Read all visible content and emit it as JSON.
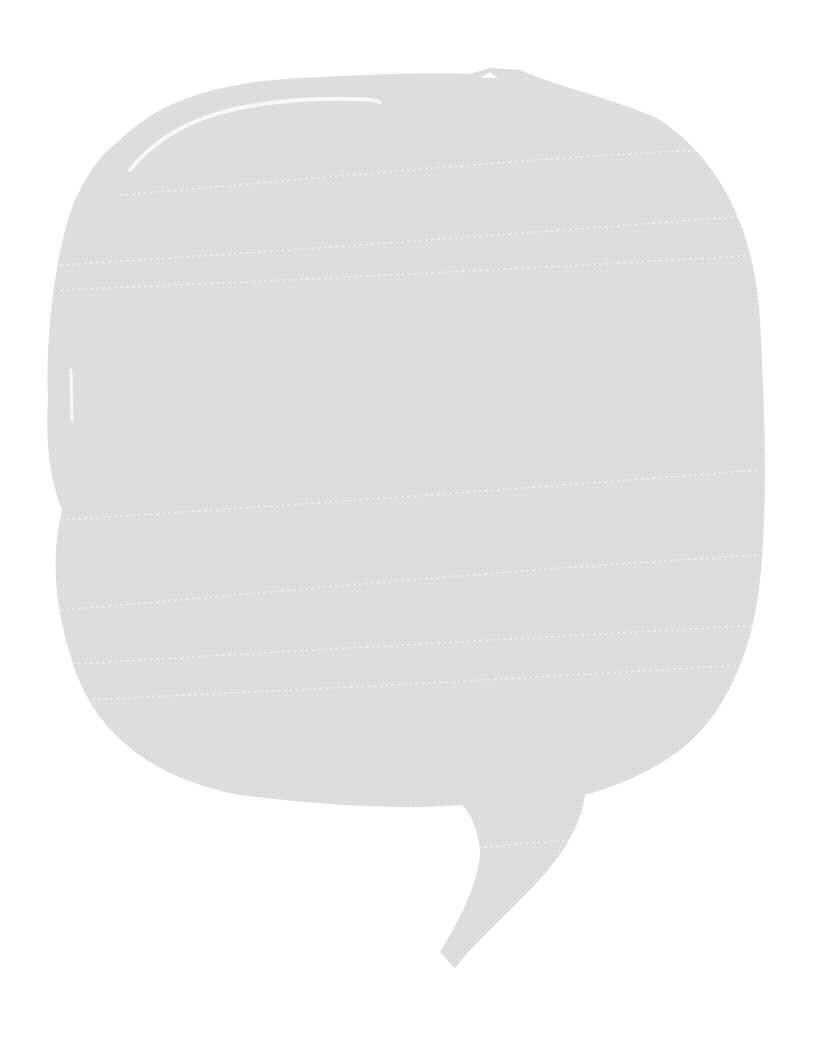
{
  "image": {
    "background_color": "#ffffff",
    "subject": "speech-bubble",
    "bubble": {
      "fill_color": "#dcdcdc",
      "texture_color": "#cfcfcf",
      "highlight_color": "#f4f4f4",
      "text": ""
    }
  }
}
